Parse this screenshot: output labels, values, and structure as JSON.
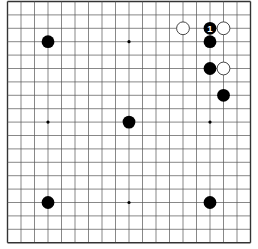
{
  "board": {
    "size": 19,
    "origin_x": 7.5,
    "origin_y": 1.5,
    "spacing_x": 13.5,
    "spacing_y": 13.4,
    "stone_radius": 6.4,
    "background": "#ffffff",
    "line_color": "#555555",
    "border_color": "#333333",
    "black_color": "#000000",
    "white_fill": "#ffffff",
    "white_stroke": "#333333",
    "label_color": "#ffffff"
  },
  "hoshi": [
    {
      "col": 3,
      "row": 3
    },
    {
      "col": 9,
      "row": 3
    },
    {
      "col": 15,
      "row": 3
    },
    {
      "col": 3,
      "row": 9
    },
    {
      "col": 9,
      "row": 9
    },
    {
      "col": 15,
      "row": 9
    },
    {
      "col": 3,
      "row": 15
    },
    {
      "col": 9,
      "row": 15
    },
    {
      "col": 15,
      "row": 15
    }
  ],
  "stones": [
    {
      "color": "black",
      "col": 3,
      "row": 3
    },
    {
      "color": "black",
      "col": 9,
      "row": 9
    },
    {
      "color": "black",
      "col": 3,
      "row": 15
    },
    {
      "color": "black",
      "col": 15,
      "row": 15
    },
    {
      "color": "white",
      "col": 13,
      "row": 2
    },
    {
      "color": "black",
      "col": 15,
      "row": 2,
      "label": "1"
    },
    {
      "color": "white",
      "col": 16,
      "row": 2
    },
    {
      "color": "black",
      "col": 15,
      "row": 3
    },
    {
      "color": "black",
      "col": 15,
      "row": 5
    },
    {
      "color": "white",
      "col": 16,
      "row": 5
    },
    {
      "color": "black",
      "col": 16,
      "row": 7
    }
  ]
}
